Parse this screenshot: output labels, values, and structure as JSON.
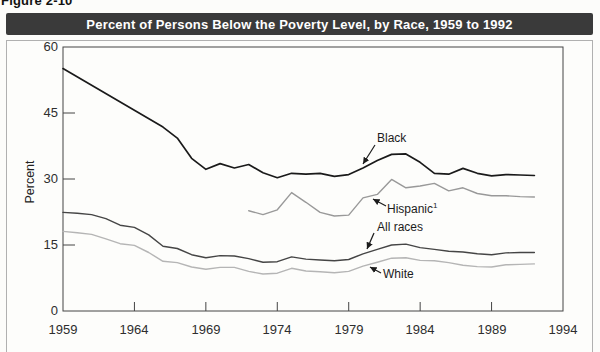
{
  "figure_label": "Figure 2-10",
  "colors": {
    "title_bar_bg": "#3a3a3a",
    "title_text": "#ffffff",
    "plot_frame": "#444444",
    "outer_border": "#b0b0b0"
  },
  "chart_data": {
    "type": "line",
    "title": "Percent of Persons Below the Poverty Level, by Race, 1959 to 1992",
    "xlabel": "",
    "ylabel": "Percent",
    "xlim": [
      1959,
      1994
    ],
    "ylim": [
      0,
      60
    ],
    "grid": false,
    "legend_position": "inline-annotations",
    "xticks": [
      1959,
      1964,
      1969,
      1974,
      1979,
      1984,
      1989,
      1994
    ],
    "yticks": [
      0,
      15,
      30,
      45,
      60
    ],
    "xtick_labels": [
      "1959",
      "1964",
      "1969",
      "1974",
      "1979",
      "1984",
      "1989",
      "1994"
    ],
    "ytick_labels_top_down": [
      "60",
      "45",
      "30",
      "15",
      "0"
    ],
    "series": [
      {
        "name": "Black",
        "color": "#1a1a1a",
        "x": [
          1959,
          1966,
          1967,
          1968,
          1969,
          1970,
          1971,
          1972,
          1973,
          1974,
          1975,
          1976,
          1977,
          1978,
          1979,
          1980,
          1981,
          1982,
          1983,
          1984,
          1985,
          1986,
          1987,
          1988,
          1989,
          1990,
          1991,
          1992
        ],
        "values": [
          55.1,
          41.8,
          39.3,
          34.7,
          32.2,
          33.5,
          32.5,
          33.3,
          31.4,
          30.3,
          31.3,
          31.1,
          31.3,
          30.6,
          31.0,
          32.5,
          34.2,
          35.6,
          35.7,
          33.8,
          31.3,
          31.1,
          32.4,
          31.3,
          30.7,
          31.0,
          30.9,
          30.8
        ]
      },
      {
        "name": "Hispanic",
        "sup": "1",
        "color": "#999999",
        "x": [
          1972,
          1973,
          1974,
          1975,
          1976,
          1977,
          1978,
          1979,
          1980,
          1981,
          1982,
          1983,
          1984,
          1985,
          1986,
          1987,
          1988,
          1989,
          1990,
          1991,
          1992
        ],
        "values": [
          22.8,
          21.9,
          23.0,
          26.9,
          24.7,
          22.4,
          21.6,
          21.8,
          25.7,
          26.5,
          29.9,
          28.0,
          28.4,
          29.0,
          27.3,
          28.0,
          26.7,
          26.2,
          26.2,
          26.0,
          25.9
        ]
      },
      {
        "name": "All races",
        "color": "#454545",
        "x": [
          1959,
          1960,
          1961,
          1962,
          1963,
          1964,
          1965,
          1966,
          1967,
          1968,
          1969,
          1970,
          1971,
          1972,
          1973,
          1974,
          1975,
          1976,
          1977,
          1978,
          1979,
          1980,
          1981,
          1982,
          1983,
          1984,
          1985,
          1986,
          1987,
          1988,
          1989,
          1990,
          1991,
          1992
        ],
        "values": [
          22.4,
          22.2,
          21.9,
          21.0,
          19.5,
          19.0,
          17.3,
          14.7,
          14.2,
          12.8,
          12.1,
          12.6,
          12.5,
          11.9,
          11.1,
          11.2,
          12.3,
          11.8,
          11.6,
          11.4,
          11.7,
          13.0,
          14.0,
          15.0,
          15.2,
          14.4,
          14.0,
          13.6,
          13.4,
          13.0,
          12.8,
          13.2,
          13.3,
          13.3
        ]
      },
      {
        "name": "White",
        "color": "#b5b5b5",
        "x": [
          1959,
          1960,
          1961,
          1962,
          1963,
          1964,
          1965,
          1966,
          1967,
          1968,
          1969,
          1970,
          1971,
          1972,
          1973,
          1974,
          1975,
          1976,
          1977,
          1978,
          1979,
          1980,
          1981,
          1982,
          1983,
          1984,
          1985,
          1986,
          1987,
          1988,
          1989,
          1990,
          1991,
          1992
        ],
        "values": [
          18.1,
          17.8,
          17.4,
          16.4,
          15.3,
          14.9,
          13.3,
          11.3,
          11.0,
          10.0,
          9.5,
          9.9,
          9.9,
          9.0,
          8.4,
          8.6,
          9.7,
          9.1,
          8.9,
          8.7,
          9.0,
          10.2,
          11.1,
          12.0,
          12.1,
          11.5,
          11.4,
          11.0,
          10.4,
          10.1,
          10.0,
          10.5,
          10.6,
          10.7
        ]
      }
    ]
  }
}
